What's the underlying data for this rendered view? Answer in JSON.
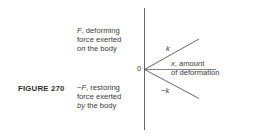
{
  "figure": {
    "label": "FIGURE 270"
  },
  "diagram": {
    "origin_label": "0",
    "upper_label": {
      "line1_symbol": "F",
      "line1_rest": ", deforming",
      "line2": "force exerted",
      "line3_italic": "on",
      "line3_rest": " the body"
    },
    "lower_label": {
      "line1_prefix": "−",
      "line1_symbol": "F",
      "line1_rest": ", restoring",
      "line2": "force exerted",
      "line3_italic": "by",
      "line3_rest": " the body"
    },
    "x_axis_label": {
      "line1_symbol": "x",
      "line1_rest": ", amount",
      "line2": "of deformation"
    },
    "upper_line_label": "k",
    "lower_line_label_prefix": "−",
    "lower_line_label_symbol": "k",
    "colors": {
      "axis": "#555555",
      "text": "#3a3a3a"
    }
  }
}
